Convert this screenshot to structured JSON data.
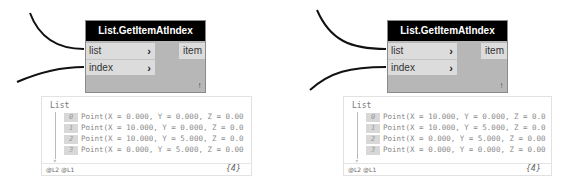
{
  "panels": [
    {
      "node": {
        "title": "List.GetItemAtIndex",
        "inputs": [
          {
            "label": "list",
            "chevron": "›"
          },
          {
            "label": "index",
            "chevron": "›"
          }
        ],
        "output": "item",
        "lacing": "!"
      },
      "preview": {
        "title": "List",
        "rows": [
          {
            "index": "0",
            "value": "Point(X = 0.000, Y = 0.000, Z = 0.00"
          },
          {
            "index": "1",
            "value": "Point(X = 10.000, Y = 0.000, Z = 0.0"
          },
          {
            "index": "2",
            "value": "Point(X = 10.000, Y = 5.000, Z = 0.0"
          },
          {
            "index": "3",
            "value": "Point(X = 0.000, Y = 5.000, Z = 0.00"
          }
        ],
        "levels": "@L2 @L1",
        "count": "{4}"
      }
    },
    {
      "node": {
        "title": "List.GetItemAtIndex",
        "inputs": [
          {
            "label": "list",
            "chevron": "›"
          },
          {
            "label": "index",
            "chevron": "›"
          }
        ],
        "output": "item",
        "lacing": "!"
      },
      "preview": {
        "title": "List",
        "rows": [
          {
            "index": "0",
            "value": "Point(X = 10.000, Y = 0.000, Z = 0.0"
          },
          {
            "index": "1",
            "value": "Point(X = 10.000, Y = 5.000, Z = 0.0"
          },
          {
            "index": "2",
            "value": "Point(X = 0.000, Y = 5.000, Z = 0.00"
          },
          {
            "index": "3",
            "value": "Point(X = 0.000, Y = 0.000, Z = 0.00"
          }
        ],
        "levels": "@L2 @L1",
        "count": "{4}"
      }
    }
  ]
}
